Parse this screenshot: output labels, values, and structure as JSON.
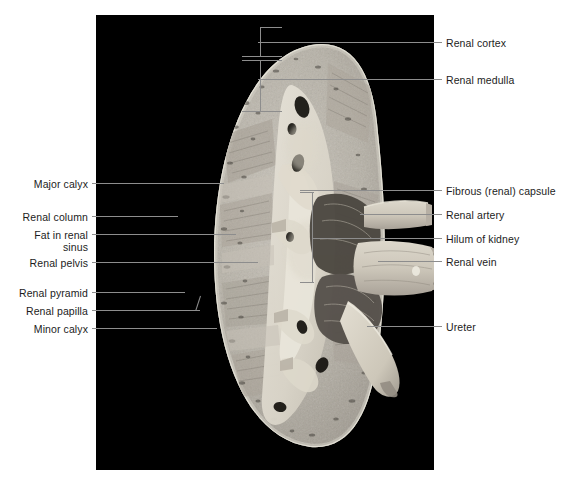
{
  "plate": {
    "title": "Coronal section of the kidney",
    "background_color": "#ffffff",
    "panel_color": "#000000",
    "leader_color": "#8d8d8d",
    "text_color": "#1c1c1c"
  },
  "photo": {
    "caption": "kidney-coronal-section-photograph",
    "specimen": "human kidney, coronal (frontal) section, gross specimen"
  },
  "labels_left": [
    {
      "id": "major-calyx",
      "text": "Major calyx",
      "text_x": 88,
      "text_y": 178,
      "line_x1": 92,
      "line_x2": 224,
      "line_y": 183
    },
    {
      "id": "renal-column",
      "text": "Renal column",
      "text_x": 88,
      "text_y": 211,
      "line_x1": 92,
      "line_x2": 178,
      "line_y": 216
    },
    {
      "id": "fat-renal-sinus-1",
      "text": "Fat in renal",
      "text_x": 88,
      "text_y": 229,
      "line_x1": 92,
      "line_x2": 236,
      "line_y": 234
    },
    {
      "id": "fat-renal-sinus-2",
      "text": "sinus",
      "text_x": 88,
      "text_y": 241
    },
    {
      "id": "renal-pelvis",
      "text": "Renal pelvis",
      "text_x": 88,
      "text_y": 257,
      "line_x1": 92,
      "line_x2": 258,
      "line_y": 262
    },
    {
      "id": "renal-pyramid",
      "text": "Renal pyramid",
      "text_x": 88,
      "text_y": 287,
      "line_x1": 92,
      "line_x2": 185,
      "line_y": 292
    },
    {
      "id": "renal-papilla",
      "text": "Renal papilla",
      "text_x": 88,
      "text_y": 305,
      "line_x1": 92,
      "line_x2": 200,
      "line_y": 310
    },
    {
      "id": "minor-calyx",
      "text": "Minor calyx",
      "text_x": 88,
      "text_y": 323,
      "line_x1": 92,
      "line_x2": 217,
      "line_y": 328
    }
  ],
  "labels_right": [
    {
      "id": "renal-cortex",
      "text": "Renal cortex",
      "text_x": 446,
      "text_y": 37,
      "line_x1": 258,
      "line_x2": 442,
      "line_y": 42
    },
    {
      "id": "renal-medulla",
      "text": "Renal medulla",
      "text_x": 446,
      "text_y": 74,
      "line_x1": 258,
      "line_x2": 442,
      "line_y": 79
    },
    {
      "id": "fibrous-renal-capsule",
      "text": "Fibrous (renal) capsule",
      "text_x": 446,
      "text_y": 185,
      "line_x1": 300,
      "line_x2": 442,
      "line_y": 190
    },
    {
      "id": "renal-artery",
      "text": "Renal artery",
      "text_x": 446,
      "text_y": 209,
      "line_x1": 360,
      "line_x2": 442,
      "line_y": 214
    },
    {
      "id": "hilum-of-kidney",
      "text": "Hilum of kidney",
      "text_x": 446,
      "text_y": 233,
      "line_x1": 312,
      "line_x2": 442,
      "line_y": 238
    },
    {
      "id": "renal-vein",
      "text": "Renal vein",
      "text_x": 446,
      "text_y": 256,
      "line_x1": 378,
      "line_x2": 442,
      "line_y": 261
    },
    {
      "id": "ureter",
      "text": "Ureter",
      "text_x": 446,
      "text_y": 321,
      "line_x1": 367,
      "line_x2": 442,
      "line_y": 326
    }
  ],
  "brackets": [
    {
      "id": "cortex-bracket",
      "x": 260,
      "y_top": 27,
      "y_bottom": 55,
      "tick_len": 22,
      "note": "vertical bracket marking the renal cortex band"
    },
    {
      "id": "medulla-bracket",
      "x": 260,
      "y_top": 57,
      "y_bottom": 110,
      "tick_len": 22,
      "note": "vertical bracket marking the renal medulla (pyramid)"
    },
    {
      "id": "hilum-bracket",
      "x": 312,
      "y_top": 192,
      "y_bottom": 283,
      "tick_len": 16,
      "note": "vertical bracket marking the hilum of the kidney"
    }
  ]
}
